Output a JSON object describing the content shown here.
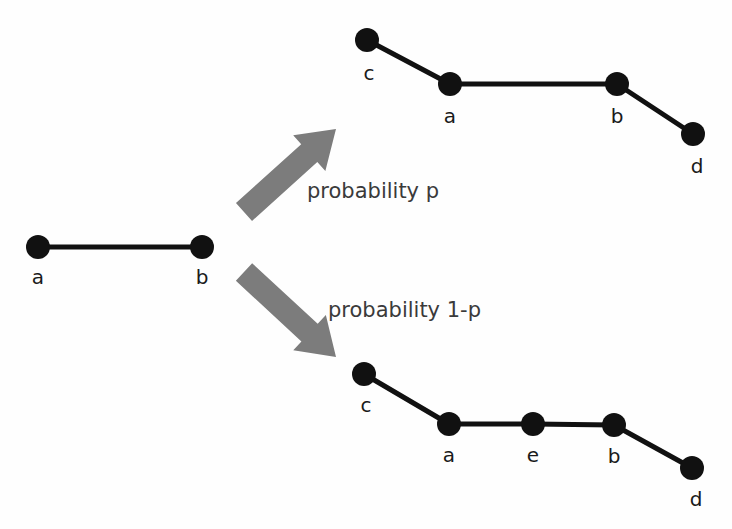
{
  "figure": {
    "kind": "stochastic-graph-transformation-diagram",
    "background_color": "#fefefe",
    "node_color": "#111111",
    "edge_color": "#111111",
    "arrow_color": "#7c7c7c",
    "label_color": "#1a1a1a",
    "branch_text_color": "#3a3a3a",
    "node_radius": 12,
    "edge_width": 5
  },
  "source_graph": {
    "name": "source-graph",
    "nodes": [
      {
        "id": "a",
        "label": "a",
        "x": 38,
        "y": 247,
        "label_x": 38,
        "label_y": 284
      },
      {
        "id": "b",
        "label": "b",
        "x": 202,
        "y": 247,
        "label_x": 202,
        "label_y": 284
      }
    ],
    "edges": [
      {
        "from": "a",
        "to": "b"
      }
    ]
  },
  "branches": [
    {
      "id": "upper",
      "name": "probability-p-branch",
      "label": "probability p",
      "label_x": 307,
      "label_y": 198,
      "arrow": {
        "name": "arrow-up-right",
        "from_x": 244,
        "from_y": 212,
        "to_x": 336,
        "to_y": 129,
        "shaft_width": 24,
        "head_width": 48,
        "head_length": 36
      },
      "result_graph": {
        "name": "result-graph-upper",
        "nodes": [
          {
            "id": "c",
            "label": "c",
            "x": 367,
            "y": 40,
            "label_x": 369,
            "label_y": 80
          },
          {
            "id": "a",
            "label": "a",
            "x": 450,
            "y": 84,
            "label_x": 450,
            "label_y": 123
          },
          {
            "id": "b",
            "label": "b",
            "x": 617,
            "y": 84,
            "label_x": 617,
            "label_y": 123
          },
          {
            "id": "d",
            "label": "d",
            "x": 693,
            "y": 134,
            "label_x": 697,
            "label_y": 173
          }
        ],
        "edges": [
          {
            "from": "c",
            "to": "a"
          },
          {
            "from": "a",
            "to": "b"
          },
          {
            "from": "b",
            "to": "d"
          }
        ]
      }
    },
    {
      "id": "lower",
      "name": "probability-1-minus-p-branch",
      "label": "probability 1-p",
      "label_x": 328,
      "label_y": 317,
      "arrow": {
        "name": "arrow-down-right",
        "from_x": 244,
        "from_y": 272,
        "to_x": 336,
        "to_y": 357,
        "shaft_width": 24,
        "head_width": 48,
        "head_length": 36
      },
      "result_graph": {
        "name": "result-graph-lower",
        "nodes": [
          {
            "id": "c",
            "label": "c",
            "x": 364,
            "y": 374,
            "label_x": 366,
            "label_y": 412
          },
          {
            "id": "a",
            "label": "a",
            "x": 449,
            "y": 424,
            "label_x": 449,
            "label_y": 462
          },
          {
            "id": "e",
            "label": "e",
            "x": 533,
            "y": 424,
            "label_x": 533,
            "label_y": 462
          },
          {
            "id": "b",
            "label": "b",
            "x": 614,
            "y": 425,
            "label_x": 614,
            "label_y": 463
          },
          {
            "id": "d",
            "label": "d",
            "x": 692,
            "y": 468,
            "label_x": 696,
            "label_y": 506
          }
        ],
        "edges": [
          {
            "from": "c",
            "to": "a"
          },
          {
            "from": "a",
            "to": "e"
          },
          {
            "from": "e",
            "to": "b"
          },
          {
            "from": "b",
            "to": "d"
          }
        ]
      }
    }
  ]
}
